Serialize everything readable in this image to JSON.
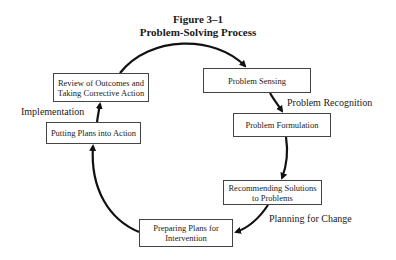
{
  "figure": {
    "number": "Figure 3–1",
    "title": "Problem-Solving Process"
  },
  "nodes": [
    {
      "id": "problem-sensing",
      "label": "Problem Sensing"
    },
    {
      "id": "problem-formulation",
      "label": "Problem Formulation"
    },
    {
      "id": "recommending-solutions",
      "label": "Recommending Solutions to Problems"
    },
    {
      "id": "preparing-plans",
      "label": "Preparing Plans for Intervention"
    },
    {
      "id": "putting-plans-into-action",
      "label": "Putting Plans into Action"
    },
    {
      "id": "review-outcomes",
      "label": "Review of Outcomes and Taking Corrective Action"
    }
  ],
  "phases": {
    "recognition": "Problem Recognition",
    "planning": "Planning for Change",
    "implementation": "Implementation"
  },
  "edges": [
    {
      "from": "review-outcomes",
      "to": "problem-sensing"
    },
    {
      "from": "problem-sensing",
      "to": "problem-formulation"
    },
    {
      "from": "problem-formulation",
      "to": "recommending-solutions"
    },
    {
      "from": "recommending-solutions",
      "to": "preparing-plans"
    },
    {
      "from": "preparing-plans",
      "to": "putting-plans-into-action"
    },
    {
      "from": "putting-plans-into-action",
      "to": "review-outcomes"
    }
  ]
}
